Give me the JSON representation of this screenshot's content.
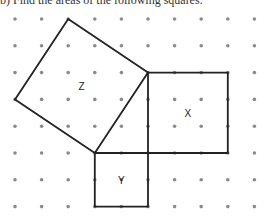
{
  "header": {
    "text": "b) Find the areas of the following squares:"
  },
  "figure": {
    "grid": {
      "columns": 10,
      "rows": 8,
      "dot_color": "#8a8a8a"
    },
    "line_color": "#222222",
    "squares": [
      {
        "label": "Z",
        "vertices_grid": [
          [
            2,
            0
          ],
          [
            5,
            2
          ],
          [
            3,
            5
          ],
          [
            0,
            3
          ]
        ]
      },
      {
        "label": "X",
        "vertices_grid": [
          [
            5,
            2
          ],
          [
            8,
            2
          ],
          [
            8,
            5
          ],
          [
            5,
            5
          ]
        ]
      },
      {
        "label": "Y",
        "vertices_grid": [
          [
            3,
            5
          ],
          [
            5,
            5
          ],
          [
            5,
            7
          ],
          [
            3,
            7
          ]
        ]
      }
    ]
  }
}
